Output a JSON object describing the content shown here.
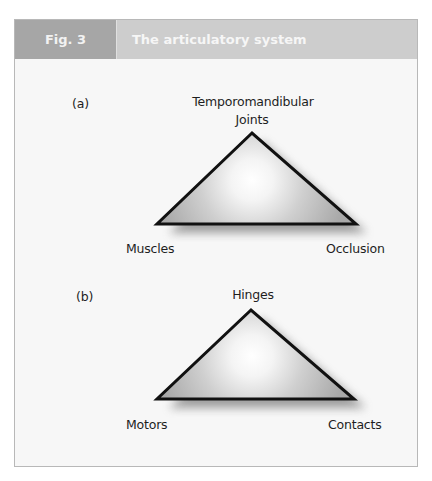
{
  "header": {
    "fig_label": "Fig. 3",
    "title": "The articulatory system"
  },
  "panels": [
    {
      "label": "(a)",
      "top_label_line1": "Temporomandibular",
      "top_label_line2": "Joints",
      "left_label": "Muscles",
      "right_label": "Occlusion"
    },
    {
      "label": "(b)",
      "top_label_line1": "Hinges",
      "left_label": "Motors",
      "right_label": "Contacts"
    }
  ],
  "colors": {
    "header_dark": "#a6a6a6",
    "header_light": "#cdcdcd",
    "triangle_edge": "#111111",
    "triangle_fill": "#bdbdbd"
  }
}
